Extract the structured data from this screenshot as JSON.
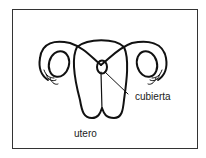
{
  "diagram": {
    "labels": {
      "cubierta": "cubierta",
      "utero": "utero"
    },
    "colors": {
      "stroke": "#111111",
      "frame": "#333333",
      "background": "#ffffff"
    }
  }
}
